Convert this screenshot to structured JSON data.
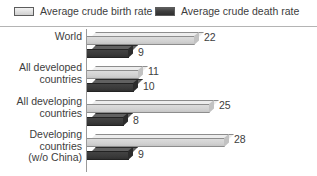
{
  "chart_data": {
    "type": "bar",
    "orientation": "horizontal",
    "title": "",
    "xlabel": "",
    "ylabel": "",
    "grid": false,
    "legend_position": "top",
    "xlim": [
      0,
      30
    ],
    "categories": [
      "World",
      "All developed countries",
      "All developing countries",
      "Developing countries (w/o China)"
    ],
    "series": [
      {
        "name": "Average crude birth rate",
        "color": "#d2d2d2",
        "values": [
          22,
          11,
          25,
          28
        ]
      },
      {
        "name": "Average crude death rate",
        "color": "#3a3a3a",
        "values": [
          9,
          10,
          8,
          9
        ]
      }
    ]
  },
  "legend": {
    "entries": [
      {
        "label": "Average crude birth rate",
        "swatch": "birth-rate-swatch"
      },
      {
        "label": "Average crude death rate",
        "swatch": "death-rate-swatch"
      }
    ]
  },
  "groups": [
    {
      "label_lines": [
        "World"
      ],
      "birth_value": "22",
      "death_value": "9"
    },
    {
      "label_lines": [
        "All developed",
        "countries"
      ],
      "birth_value": "11",
      "death_value": "10"
    },
    {
      "label_lines": [
        "All developing",
        "countries"
      ],
      "birth_value": "25",
      "death_value": "8"
    },
    {
      "label_lines": [
        "Developing",
        "countries",
        "(w/o China)"
      ],
      "birth_value": "28",
      "death_value": "9"
    }
  ]
}
